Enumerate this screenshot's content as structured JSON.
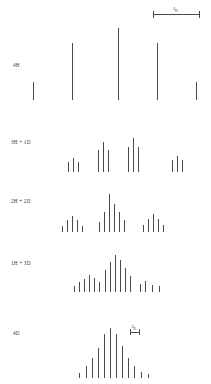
{
  "figure": {
    "title": "",
    "background": "#ffffff",
    "stick_color": "#4a4a4a",
    "scale_bar": {
      "label": "J",
      "sub": "H",
      "x": 153,
      "y": 8,
      "width": 46
    },
    "jd_annotation": {
      "label": "J",
      "sub": "D",
      "x": 130,
      "y": 327,
      "width": 9
    },
    "rows": [
      {
        "label": "4H",
        "label_x": 13,
        "label_y": 62,
        "baseline_y": 100,
        "sticks": [
          {
            "x": 33,
            "h": 18
          },
          {
            "x": 72,
            "h": 57
          },
          {
            "x": 118,
            "h": 72
          },
          {
            "x": 157,
            "h": 57
          },
          {
            "x": 196,
            "h": 18
          }
        ]
      },
      {
        "label": "3H + 1D",
        "label_x": 11,
        "label_y": 139,
        "baseline_y": 172,
        "sticks": [
          {
            "x": 68,
            "h": 10
          },
          {
            "x": 73,
            "h": 14
          },
          {
            "x": 78,
            "h": 10
          },
          {
            "x": 98,
            "h": 22
          },
          {
            "x": 103,
            "h": 30
          },
          {
            "x": 108,
            "h": 22
          },
          {
            "x": 128,
            "h": 25
          },
          {
            "x": 133,
            "h": 34
          },
          {
            "x": 138,
            "h": 25
          },
          {
            "x": 172,
            "h": 12
          },
          {
            "x": 177,
            "h": 16
          },
          {
            "x": 182,
            "h": 12
          }
        ]
      },
      {
        "label": "2H + 2D",
        "label_x": 11,
        "label_y": 198,
        "baseline_y": 232,
        "sticks": [
          {
            "x": 62,
            "h": 6
          },
          {
            "x": 67,
            "h": 12
          },
          {
            "x": 72,
            "h": 16
          },
          {
            "x": 77,
            "h": 12
          },
          {
            "x": 82,
            "h": 6
          },
          {
            "x": 99,
            "h": 10
          },
          {
            "x": 104,
            "h": 20
          },
          {
            "x": 109,
            "h": 38
          },
          {
            "x": 114,
            "h": 28
          },
          {
            "x": 119,
            "h": 20
          },
          {
            "x": 124,
            "h": 12
          },
          {
            "x": 143,
            "h": 7
          },
          {
            "x": 148,
            "h": 13
          },
          {
            "x": 153,
            "h": 18
          },
          {
            "x": 158,
            "h": 13
          },
          {
            "x": 163,
            "h": 7
          }
        ]
      },
      {
        "label": "1H + 3D",
        "label_x": 11,
        "label_y": 260,
        "baseline_y": 292,
        "sticks": [
          {
            "x": 74,
            "h": 6
          },
          {
            "x": 79,
            "h": 10
          },
          {
            "x": 84,
            "h": 13
          },
          {
            "x": 89,
            "h": 17
          },
          {
            "x": 94,
            "h": 14
          },
          {
            "x": 99,
            "h": 10
          },
          {
            "x": 105,
            "h": 22
          },
          {
            "x": 110,
            "h": 30
          },
          {
            "x": 115,
            "h": 37
          },
          {
            "x": 120,
            "h": 32
          },
          {
            "x": 125,
            "h": 24
          },
          {
            "x": 130,
            "h": 16
          },
          {
            "x": 140,
            "h": 8
          },
          {
            "x": 145,
            "h": 11
          },
          {
            "x": 152,
            "h": 7
          },
          {
            "x": 159,
            "h": 6
          }
        ]
      },
      {
        "label": "4D",
        "label_x": 13,
        "label_y": 330,
        "baseline_y": 378,
        "sticks": [
          {
            "x": 79,
            "h": 5
          },
          {
            "x": 86,
            "h": 12
          },
          {
            "x": 92,
            "h": 20
          },
          {
            "x": 98,
            "h": 30
          },
          {
            "x": 104,
            "h": 44
          },
          {
            "x": 110,
            "h": 50
          },
          {
            "x": 116,
            "h": 44
          },
          {
            "x": 122,
            "h": 32
          },
          {
            "x": 128,
            "h": 20
          },
          {
            "x": 134,
            "h": 12
          },
          {
            "x": 141,
            "h": 6
          },
          {
            "x": 148,
            "h": 4
          }
        ]
      }
    ]
  }
}
